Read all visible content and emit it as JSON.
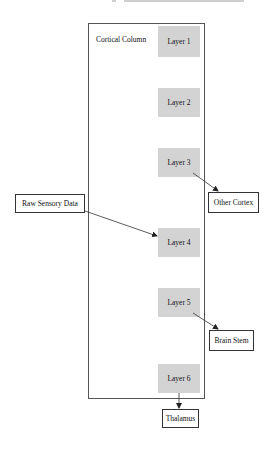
{
  "diagram": {
    "cluster": {
      "label": "Cortical Column",
      "x": 88,
      "y": 23,
      "w": 117,
      "h": 376
    },
    "layers": [
      {
        "id": "layer1",
        "label": "Layer 1",
        "x": 158,
        "y": 26,
        "w": 42,
        "h": 31
      },
      {
        "id": "layer2",
        "label": "Layer 2",
        "x": 158,
        "y": 88,
        "w": 42,
        "h": 29
      },
      {
        "id": "layer3",
        "label": "Layer 3",
        "x": 158,
        "y": 148,
        "w": 42,
        "h": 29
      },
      {
        "id": "layer4",
        "label": "Layer 4",
        "x": 158,
        "y": 228,
        "w": 42,
        "h": 29
      },
      {
        "id": "layer5",
        "label": "Layer 5",
        "x": 158,
        "y": 288,
        "w": 42,
        "h": 29
      },
      {
        "id": "layer6",
        "label": "Layer 6",
        "x": 158,
        "y": 364,
        "w": 42,
        "h": 29
      }
    ],
    "external_nodes": [
      {
        "id": "raw",
        "label": "Raw Sensory Data",
        "x": 15,
        "y": 194,
        "w": 70,
        "h": 19
      },
      {
        "id": "other_cortex",
        "label": "Other Cortex",
        "x": 208,
        "y": 192,
        "w": 51,
        "h": 21
      },
      {
        "id": "brain_stem",
        "label": "Brain Stem",
        "x": 209,
        "y": 330,
        "w": 45,
        "h": 21
      },
      {
        "id": "thalamus",
        "label": "Thalamus",
        "x": 162,
        "y": 409,
        "w": 37,
        "h": 19
      }
    ],
    "edges": [
      {
        "from": "raw",
        "to": "layer4"
      },
      {
        "from": "layer3",
        "to": "other_cortex"
      },
      {
        "from": "layer5",
        "to": "brain_stem"
      },
      {
        "from": "layer6",
        "to": "thalamus"
      }
    ],
    "colors": {
      "layer_fill": "#d3d3d3",
      "node_fill": "#ffffff",
      "stroke": "#333333"
    }
  }
}
